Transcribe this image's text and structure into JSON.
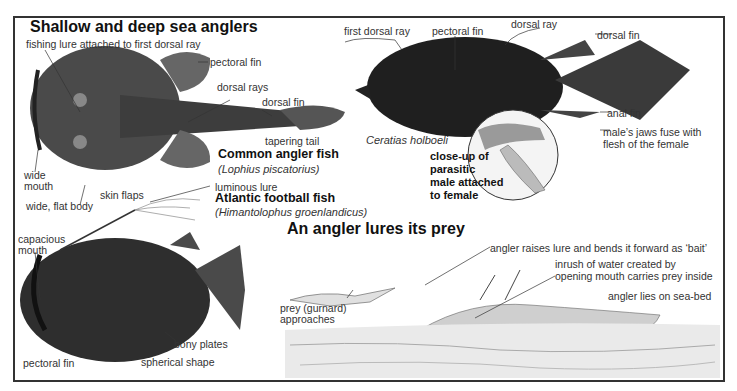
{
  "sections": {
    "shallow_deep": {
      "title": "Shallow and deep sea anglers"
    },
    "lures_prey": {
      "title": "An angler lures its prey"
    }
  },
  "common_angler": {
    "name": "Common angler fish",
    "scientific": "(Lophius piscatorius)",
    "labels": {
      "lure": "fishing lure attached to first dorsal ray",
      "pectoral_fin": "pectoral fin",
      "dorsal_rays": "dorsal rays",
      "dorsal_fin": "dorsal fin",
      "tapering_tail": "tapering tail",
      "wide_mouth_1": "wide",
      "wide_mouth_2": "mouth",
      "skin_flaps": "skin flaps",
      "flat_body": "wide, flat body"
    }
  },
  "ceratias": {
    "scientific": "Ceratias holboeli",
    "labels": {
      "first_dorsal_ray": "first dorsal ray",
      "pectoral_fin": "pectoral fin",
      "dorsal_ray": "dorsal ray",
      "dorsal_fin": "dorsal fin",
      "anal_fin": "anal fin",
      "jaws_fuse_1": "male’s jaws fuse with",
      "jaws_fuse_2": "flesh of the female"
    },
    "closeup": {
      "line1": "close-up of",
      "line2": "parasitic",
      "line3": "male attached",
      "line4": "to female"
    }
  },
  "football_fish": {
    "name": "Atlantic football fish",
    "scientific": "(Himantolophus groenlandicus)",
    "labels": {
      "luminous_lure": "luminous lure",
      "capacious_1": "capacious",
      "capacious_2": "mouth",
      "bony_plates": "bony plates",
      "spherical": "spherical shape",
      "pectoral_fin": "pectoral fin"
    }
  },
  "lure_scene": {
    "labels": {
      "raises_lure": "angler raises lure and bends it forward as ‘bait’",
      "inrush_1": "inrush of water created by",
      "inrush_2": "opening mouth carries prey inside",
      "prey_1": "prey (gurnard)",
      "prey_2": "approaches",
      "sea_bed": "angler lies on sea-bed"
    }
  },
  "colors": {
    "frame": "#333333",
    "fish_dark": "#2a2a2a",
    "fish_mid": "#555555",
    "sketch": "#888888"
  }
}
